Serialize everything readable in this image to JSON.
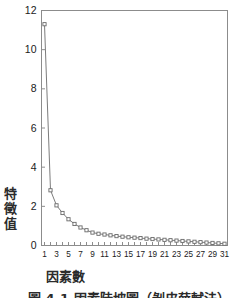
{
  "figure": {
    "y_axis_title": "特徵值",
    "y_axis_title_chars": [
      "特",
      "徵",
      "值"
    ],
    "x_axis_title": "因素數",
    "caption": "圖 4-1   因素陡坡圖（剝皮薛軾法）"
  },
  "chart_data": {
    "type": "line",
    "title": "",
    "subtitle": "",
    "xlabel": "因素數",
    "ylabel": "特徵值",
    "xlim": [
      0.5,
      31.5
    ],
    "ylim": [
      0,
      12
    ],
    "yticks": [
      0,
      2,
      4,
      6,
      8,
      10,
      12
    ],
    "xticks": [
      1,
      3,
      5,
      7,
      9,
      11,
      13,
      15,
      17,
      19,
      21,
      23,
      25,
      27,
      29,
      31
    ],
    "grid": false,
    "legend": null,
    "marker": "open-square",
    "line_color": "#7c7c7c",
    "marker_edge_color": "#6a6a6a",
    "marker_face_color": "#ffffff",
    "axis_color": "#8c8c8c",
    "x": [
      1,
      2,
      3,
      4,
      5,
      6,
      7,
      8,
      9,
      10,
      11,
      12,
      13,
      14,
      15,
      16,
      17,
      18,
      19,
      20,
      21,
      22,
      23,
      24,
      25,
      26,
      27,
      28,
      29,
      30,
      31
    ],
    "values": [
      11.3,
      2.82,
      2.05,
      1.66,
      1.34,
      1.1,
      0.92,
      0.78,
      0.66,
      0.6,
      0.56,
      0.52,
      0.48,
      0.45,
      0.42,
      0.4,
      0.38,
      0.35,
      0.33,
      0.31,
      0.29,
      0.27,
      0.25,
      0.23,
      0.21,
      0.19,
      0.17,
      0.15,
      0.13,
      0.11,
      0.09
    ]
  }
}
